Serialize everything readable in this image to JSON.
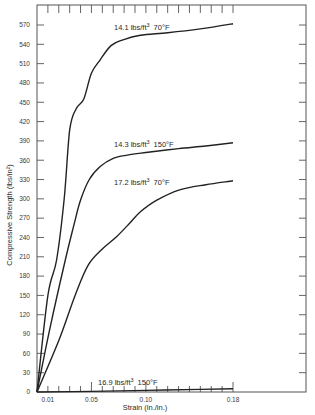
{
  "chart_data": {
    "type": "line",
    "title": "",
    "xlabel": "Strain (in./in.)",
    "ylabel": "Compressive Strength (lbs/in²)",
    "xlim": [
      0,
      0.18
    ],
    "ylim": [
      0,
      570
    ],
    "x_ticks": [
      {
        "value": 0.01,
        "label": "0.01"
      },
      {
        "value": 0.05,
        "label": "0.05"
      },
      {
        "value": 0.1,
        "label": "0.10"
      },
      {
        "value": 0.18,
        "label": "0.18"
      }
    ],
    "x_minor_tick_step": 0.01,
    "y_ticks": [
      0,
      30,
      60,
      90,
      120,
      150,
      180,
      210,
      240,
      270,
      300,
      330,
      360,
      390,
      420,
      450,
      480,
      510,
      540,
      570
    ],
    "grid": false,
    "legend": "none (inline curve labels)",
    "series": [
      {
        "name": "14.1 lbs/ft³ 70°F",
        "label_parts": {
          "density": "14.1 lbs/ft",
          "exp": "3",
          "temp": "70°F"
        },
        "points": [
          [
            0,
            0
          ],
          [
            0.01,
            150
          ],
          [
            0.018,
            205
          ],
          [
            0.025,
            300
          ],
          [
            0.03,
            407
          ],
          [
            0.036,
            440
          ],
          [
            0.043,
            455
          ],
          [
            0.05,
            495
          ],
          [
            0.058,
            516
          ],
          [
            0.068,
            538
          ],
          [
            0.079,
            547
          ],
          [
            0.095,
            554
          ],
          [
            0.12,
            558
          ],
          [
            0.15,
            564
          ],
          [
            0.18,
            572
          ]
        ]
      },
      {
        "name": "14.3 lbs/ft³ 150°F",
        "label_parts": {
          "density": "14.3 lbs/ft",
          "exp": "3",
          "temp": "150°F"
        },
        "points": [
          [
            0,
            0
          ],
          [
            0.012,
            100
          ],
          [
            0.026,
            205
          ],
          [
            0.034,
            260
          ],
          [
            0.04,
            298
          ],
          [
            0.048,
            330
          ],
          [
            0.058,
            350
          ],
          [
            0.07,
            363
          ],
          [
            0.083,
            368
          ],
          [
            0.1,
            372
          ],
          [
            0.13,
            378
          ],
          [
            0.155,
            382
          ],
          [
            0.18,
            387
          ]
        ]
      },
      {
        "name": "17.2 lbs/ft³ 70°F",
        "label_parts": {
          "density": "17.2 lbs/ft",
          "exp": "3",
          "temp": "70°F"
        },
        "points": [
          [
            0,
            0
          ],
          [
            0.02,
            80
          ],
          [
            0.035,
            150
          ],
          [
            0.047,
            197
          ],
          [
            0.06,
            222
          ],
          [
            0.073,
            241
          ],
          [
            0.085,
            262
          ],
          [
            0.095,
            280
          ],
          [
            0.11,
            298
          ],
          [
            0.131,
            314
          ],
          [
            0.155,
            322
          ],
          [
            0.18,
            328
          ]
        ]
      },
      {
        "name": "16.9 lbs/ft³ 150°F",
        "label_parts": {
          "density": "16.9 lbs/ft",
          "exp": "3",
          "temp": "150°F"
        },
        "points": [
          [
            0,
            0
          ],
          [
            0.05,
            1
          ],
          [
            0.1,
            2.5
          ],
          [
            0.15,
            4
          ],
          [
            0.18,
            5
          ]
        ]
      }
    ]
  }
}
